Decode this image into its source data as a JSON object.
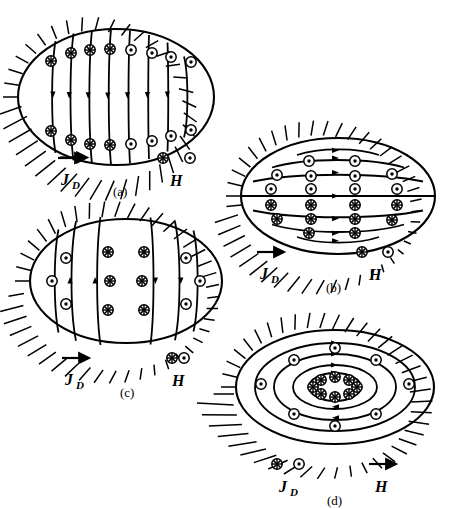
{
  "figure": {
    "type": "scientific-diagram",
    "width": 453,
    "height": 509,
    "stroke_color": "#000000",
    "background_color": "#ffffff"
  },
  "symbols": {
    "into_page": "crossed-circle",
    "out_of_page": "dotted-circle",
    "into_page_glyph": "⊕",
    "out_of_page_glyph": "⊙"
  },
  "panels": [
    {
      "id": "a",
      "caption": "(a)",
      "flux_pattern": "vertical-lines-downward",
      "line_count": 7,
      "arrow_direction": "down",
      "legend": {
        "current_label": "J",
        "current_sub": "D",
        "current_symbol": "arrow-right",
        "field_label": "H",
        "field_symbol": "circle-pair"
      },
      "markers_top": [
        "into",
        "into",
        "into",
        "into",
        "out",
        "out",
        "out",
        "out"
      ],
      "markers_bottom": [
        "into",
        "into",
        "into",
        "into",
        "out",
        "out",
        "out",
        "out"
      ]
    },
    {
      "id": "b",
      "caption": "(b)",
      "flux_pattern": "horizontal-lines-rightward",
      "line_count": 7,
      "arrow_direction": "right",
      "legend": {
        "current_label": "J",
        "current_sub": "D",
        "current_symbol": "arrow-right",
        "field_label": "H",
        "field_symbol": "circle-pair"
      },
      "markers_upper": "out",
      "markers_lower": "into",
      "rows": 6
    },
    {
      "id": "c",
      "caption": "(c)",
      "flux_pattern": "vertical-lines-converging",
      "line_count": 6,
      "arrow_direction": "up-left-down-right",
      "legend": {
        "current_label": "J",
        "current_sub": "D",
        "current_symbol": "arrow-right",
        "field_label": "H",
        "field_symbol": "circle-pair"
      },
      "markers_center": "into",
      "markers_outer": "out"
    },
    {
      "id": "d",
      "caption": "(d)",
      "flux_pattern": "concentric-ellipses-clockwise",
      "ring_count": 4,
      "arrow_direction": "clockwise",
      "legend": {
        "current_label": "J",
        "current_sub": "D",
        "current_symbol": "circle-pair",
        "field_label": "H",
        "field_symbol": "arrow-right"
      },
      "core_markers": "into",
      "core_marker_count": 8,
      "ring_markers": "out"
    }
  ]
}
